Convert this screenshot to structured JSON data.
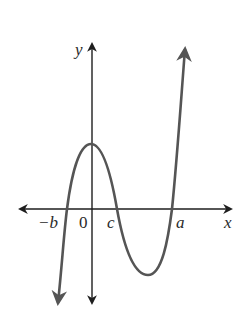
{
  "figure": {
    "type": "cubic-polynomial-graph",
    "colors": {
      "axes": "#1e1e1e",
      "curve": "#555555",
      "background": "#ffffff",
      "text": "#2a2a2a"
    },
    "axis_labels": {
      "x": "x",
      "y": "y"
    },
    "tick_labels": {
      "neg_b": "−b",
      "origin": "0",
      "c": "c",
      "a": "a"
    },
    "curve": {
      "description": "Cubic curve rising from bottom-left, crossing x-axis at -b, local maximum near y-axis, crossing at c, local minimum between c and a, crossing at a, rising to top-right",
      "x_intercepts": [
        "−b",
        "c",
        "a"
      ],
      "ends": {
        "left": "down-arrow",
        "right": "up-arrow"
      }
    }
  }
}
